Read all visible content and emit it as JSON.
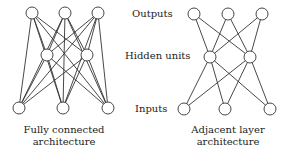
{
  "layer_labels": {
    "outputs": "Outputs",
    "hidden": "Hidden units",
    "inputs": "Inputs"
  },
  "captions": {
    "left_line1": "Fully connected",
    "left_line2": "architecture",
    "right_line1": "Adjacent layer",
    "right_line2": "architecture"
  },
  "networks": {
    "fully_connected": {
      "outputs": [
        [
          32,
          13
        ],
        [
          65,
          13
        ],
        [
          98,
          13
        ]
      ],
      "hidden": [
        [
          47,
          55
        ],
        [
          87,
          55
        ]
      ],
      "inputs": [
        [
          19,
          108
        ],
        [
          63,
          108
        ],
        [
          108,
          108
        ]
      ],
      "edges": "output-hidden, hidden-input, output-input"
    },
    "adjacent_layer": {
      "outputs": [
        [
          194,
          14
        ],
        [
          228,
          14
        ],
        [
          262,
          14
        ]
      ],
      "hidden": [
        [
          210,
          57
        ],
        [
          250,
          57
        ]
      ],
      "inputs": [
        [
          184,
          109
        ],
        [
          225,
          109
        ],
        [
          270,
          109
        ]
      ],
      "edges": "output-hidden, hidden-input"
    }
  },
  "node_radius": 6,
  "colors": {
    "line": "#333333",
    "node_fill": "#ffffff",
    "node_stroke": "#333333"
  }
}
